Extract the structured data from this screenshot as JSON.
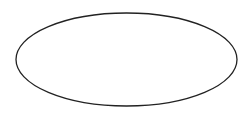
{
  "diagram": {
    "background": "#ffffff",
    "shapes": [
      {
        "type": "ellipse",
        "cx": 126.5,
        "cy": 59.5,
        "rx": 110.5,
        "ry": 46.5,
        "fill": "#ffffff",
        "stroke": "#222222",
        "stroke_width": 1.3,
        "label": ""
      }
    ]
  }
}
